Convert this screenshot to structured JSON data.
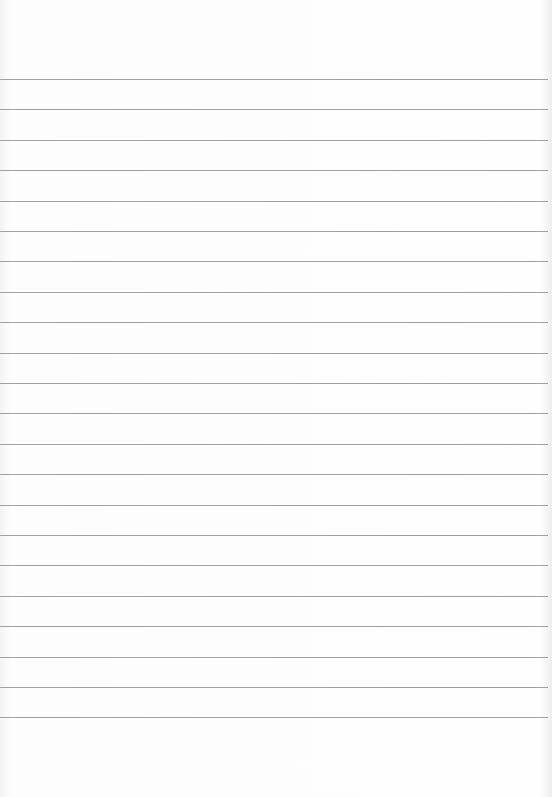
{
  "page": {
    "type": "blank ruled notebook paper",
    "line_color": "#a0a0a0",
    "background": "#fdfdfd",
    "line_count": 22,
    "first_line_y": 79,
    "line_spacing": 30.4
  }
}
